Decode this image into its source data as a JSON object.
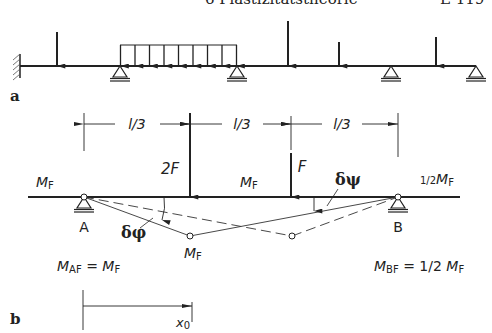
{
  "header": {
    "chapter_title": "6 Plastizitätstheorie",
    "page_number": "E 119"
  },
  "figure_a": {
    "label": "a",
    "description": "Continuous beam with fixed end, four roller/pin supports, point loads and a distributed load"
  },
  "figure_b": {
    "label": "b",
    "dimensions": [
      "l/3",
      "l/3",
      "l/3"
    ],
    "loads": {
      "left": "2F",
      "right": "F"
    },
    "moment_labels": {
      "left_end": "M",
      "left_end_sub": "F",
      "middle": "M",
      "middle_sub": "F",
      "right_end_prefix": "1/2",
      "right_end": "M",
      "right_end_sub": "F",
      "hinge": "M",
      "hinge_sub": "F"
    },
    "support_labels": {
      "left": "A",
      "right": "B"
    },
    "angles": {
      "phi": "δφ",
      "psi": "δψ"
    },
    "equations": {
      "a_lhs": "M",
      "a_lhs_sub": "AF",
      "a_eq": " = ",
      "a_rhs": "M",
      "a_rhs_sub": "F",
      "b_lhs": "M",
      "b_lhs_sub": "BF",
      "b_eq": " = 1/2 ",
      "b_rhs": "M",
      "b_rhs_sub": "F"
    },
    "coordinate_label": "x",
    "coordinate_sub": "0"
  }
}
